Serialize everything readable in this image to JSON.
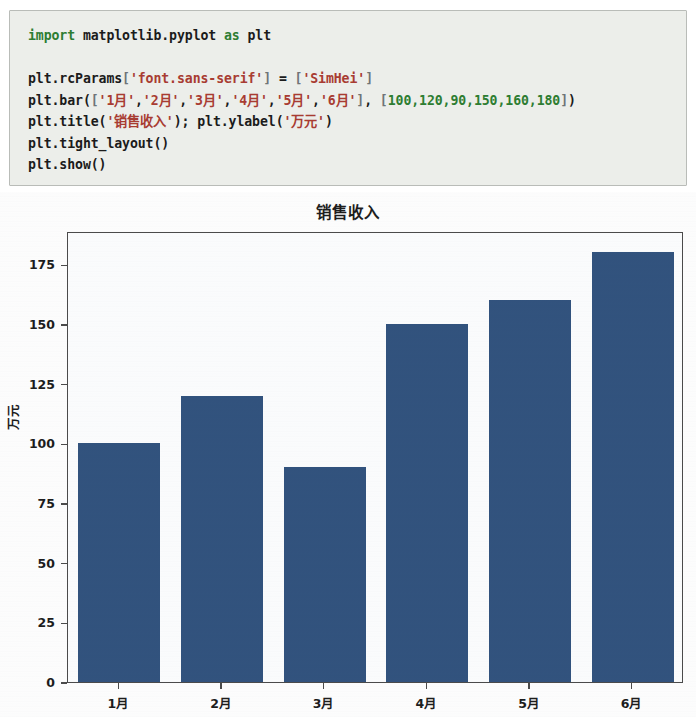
{
  "code": {
    "language": "python",
    "lines": [
      [
        {
          "t": "import",
          "c": "kw"
        },
        {
          "t": " matplotlib.pyplot ",
          "c": "pl"
        },
        {
          "t": "as",
          "c": "kw"
        },
        {
          "t": " plt",
          "c": "pl"
        }
      ],
      [],
      [
        {
          "t": "plt.rcParams",
          "c": "pl"
        },
        {
          "t": "[",
          "c": "pun"
        },
        {
          "t": "'font.sans-serif'",
          "c": "str"
        },
        {
          "t": "]",
          "c": "pun"
        },
        {
          "t": " = ",
          "c": "pl"
        },
        {
          "t": "[",
          "c": "pun"
        },
        {
          "t": "'SimHei'",
          "c": "str"
        },
        {
          "t": "]",
          "c": "pun"
        }
      ],
      [
        {
          "t": "plt.bar",
          "c": "pl"
        },
        {
          "t": "(",
          "c": "pl"
        },
        {
          "t": "[",
          "c": "pun"
        },
        {
          "t": "'1月'",
          "c": "str"
        },
        {
          "t": ",",
          "c": "pl"
        },
        {
          "t": "'2月'",
          "c": "str"
        },
        {
          "t": ",",
          "c": "pl"
        },
        {
          "t": "'3月'",
          "c": "str"
        },
        {
          "t": ",",
          "c": "pl"
        },
        {
          "t": "'4月'",
          "c": "str"
        },
        {
          "t": ",",
          "c": "pl"
        },
        {
          "t": "'5月'",
          "c": "str"
        },
        {
          "t": ",",
          "c": "pl"
        },
        {
          "t": "'6月'",
          "c": "str"
        },
        {
          "t": "]",
          "c": "pun"
        },
        {
          "t": ", ",
          "c": "pl"
        },
        {
          "t": "[",
          "c": "pun"
        },
        {
          "t": "100,120,90,150,160,180",
          "c": "num"
        },
        {
          "t": "]",
          "c": "pun"
        },
        {
          "t": ")",
          "c": "pl"
        }
      ],
      [
        {
          "t": "plt.title",
          "c": "pl"
        },
        {
          "t": "(",
          "c": "pl"
        },
        {
          "t": "'销售收入'",
          "c": "str"
        },
        {
          "t": "); ",
          "c": "pl"
        },
        {
          "t": "plt.ylabel",
          "c": "pl"
        },
        {
          "t": "(",
          "c": "pl"
        },
        {
          "t": "'万元'",
          "c": "str"
        },
        {
          "t": ")",
          "c": "pl"
        }
      ],
      [
        {
          "t": "plt.tight_layout",
          "c": "pl"
        },
        {
          "t": "()",
          "c": "pl"
        }
      ],
      [
        {
          "t": "plt.show",
          "c": "pl"
        },
        {
          "t": "()",
          "c": "pl"
        }
      ]
    ],
    "plain_text": "import matplotlib.pyplot as plt\n\nplt.rcParams['font.sans-serif'] = ['SimHei']\nplt.bar(['1月','2月','3月','4月','5月','6月'], [100,120,90,150,160,180])\nplt.title('销售收入'); plt.ylabel('万元')\nplt.tight_layout()\nplt.show()"
  },
  "chart_data": {
    "type": "bar",
    "title": "销售收入",
    "xlabel": "",
    "ylabel": "万元",
    "categories": [
      "1月",
      "2月",
      "3月",
      "4月",
      "5月",
      "6月"
    ],
    "values": [
      100,
      120,
      90,
      150,
      160,
      180
    ],
    "ylim": [
      0,
      189
    ],
    "yticks": [
      0,
      25,
      50,
      75,
      100,
      125,
      150,
      175
    ],
    "ytick_labels": [
      "0",
      "25",
      "50",
      "75",
      "100",
      "125",
      "150",
      "175"
    ],
    "grid": false,
    "legend": false,
    "bar_color": "#31527d",
    "axes_color": "#4a4a4a",
    "bar_width_ratio": 0.8
  },
  "colors": {
    "code_background": "#eceeea",
    "code_border": "#b9bcb8",
    "keyword": "#2e7d32",
    "string": "#a83c32",
    "number": "#2e7d32",
    "punctuation": "#6f7478",
    "text": "#1b1b1b",
    "figure_background": "#fdfdfd",
    "plot_background": "#fbfcfd"
  }
}
